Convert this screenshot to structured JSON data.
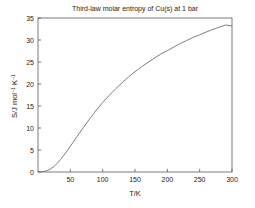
{
  "chart_data": {
    "type": "line",
    "title": "Third-law molar entropy of Cu(s) at 1 bar",
    "xlabel": "T/K",
    "ylabel": "S/J mol^-1 K^-1",
    "ylabel_parts": {
      "base1": "S/J mol",
      "sup1": "−1",
      "base2": " K",
      "sup2": "−1"
    },
    "xlim": [
      0,
      300
    ],
    "ylim": [
      0,
      35
    ],
    "grid": false,
    "legend": false,
    "xticks": [
      50,
      100,
      150,
      200,
      250,
      300
    ],
    "yticks": [
      0,
      5,
      10,
      15,
      20,
      25,
      30,
      35
    ],
    "xtick_labels": [
      "50",
      "100",
      "150",
      "200",
      "250",
      "300"
    ],
    "ytick_labels": [
      "0",
      "5",
      "10",
      "15",
      "20",
      "25",
      "30",
      "35"
    ],
    "series": [
      {
        "name": "Cu(s) third-law entropy",
        "color": "#6e6e6e",
        "x": [
          0,
          5,
          10,
          15,
          20,
          25,
          30,
          35,
          40,
          45,
          50,
          60,
          70,
          80,
          90,
          100,
          110,
          120,
          130,
          140,
          150,
          160,
          170,
          180,
          190,
          200,
          210,
          220,
          230,
          240,
          250,
          260,
          270,
          280,
          290,
          300
        ],
        "y": [
          0.0,
          0.04,
          0.15,
          0.37,
          0.75,
          1.3,
          2.0,
          2.85,
          3.8,
          4.8,
          5.85,
          8.0,
          10.1,
          12.1,
          14.0,
          15.8,
          17.4,
          18.9,
          20.3,
          21.6,
          22.8,
          23.9,
          24.9,
          25.9,
          26.8,
          27.6,
          28.4,
          29.2,
          29.9,
          30.6,
          31.2,
          31.8,
          32.4,
          32.9,
          33.4,
          33.2
        ]
      }
    ]
  },
  "figure": {
    "background_color": "#ffffff",
    "axis_color": "#5a5a5a",
    "text_color": "#1a1a1a"
  }
}
